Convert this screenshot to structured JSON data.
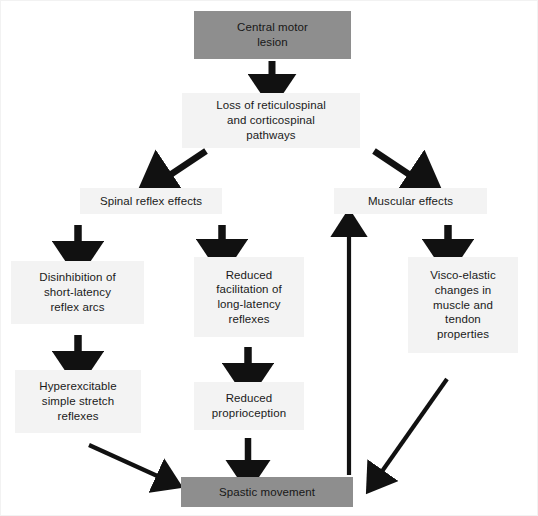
{
  "diagram": {
    "colors": {
      "dark_box": "#8e8e8e",
      "light_box": "#f3f3f3",
      "arrow": "#111111",
      "text": "#1a1a1a",
      "background": "#ffffff",
      "frame": "#f2f2f2"
    },
    "nodes": [
      {
        "id": "central-motor-lesion",
        "label": "Central motor\nlesion",
        "style": "dark",
        "x": 193,
        "y": 10,
        "w": 157,
        "h": 48
      },
      {
        "id": "loss-of-pathways",
        "label": "Loss of reticulospinal\nand corticospinal\npathways",
        "style": "light",
        "x": 181,
        "y": 92,
        "w": 178,
        "h": 55
      },
      {
        "id": "spinal-reflex-effects",
        "label": "Spinal reflex effects",
        "style": "light",
        "x": 79,
        "y": 187,
        "w": 142,
        "h": 26
      },
      {
        "id": "muscular-effects",
        "label": "Muscular effects",
        "style": "light",
        "x": 333,
        "y": 187,
        "w": 153,
        "h": 26
      },
      {
        "id": "disinhibition-short-latency",
        "label": "Disinhibition of\nshort-latency\nreflex arcs",
        "style": "light",
        "x": 10,
        "y": 260,
        "w": 133,
        "h": 63
      },
      {
        "id": "reduced-facilitation",
        "label": "Reduced\nfacilitation of\nlong-latency\nreflexes",
        "style": "light",
        "x": 193,
        "y": 256,
        "w": 110,
        "h": 80
      },
      {
        "id": "visco-elastic-changes",
        "label": "Visco-elastic\nchanges in\nmuscle and\ntendon\nproperties",
        "style": "light",
        "x": 407,
        "y": 256,
        "w": 110,
        "h": 96
      },
      {
        "id": "hyperexcitable-stretch-reflexes",
        "label": "Hyperexcitable\nsimple stretch\nreflexes",
        "style": "light",
        "x": 14,
        "y": 369,
        "w": 126,
        "h": 63
      },
      {
        "id": "reduced-proprioception",
        "label": "Reduced\nproprioception",
        "style": "light",
        "x": 193,
        "y": 381,
        "w": 110,
        "h": 48
      },
      {
        "id": "spastic-movement",
        "label": "Spastic movement",
        "style": "dark",
        "x": 180,
        "y": 476,
        "w": 172,
        "h": 30
      }
    ],
    "arrows": [
      {
        "id": "arrow-lesion-to-loss",
        "from": "central-motor-lesion",
        "to": "loss-of-pathways",
        "kind": "vertical-down"
      },
      {
        "id": "arrow-loss-to-spinal",
        "from": "loss-of-pathways",
        "to": "spinal-reflex-effects",
        "kind": "diagonal-down-left"
      },
      {
        "id": "arrow-loss-to-muscular",
        "from": "loss-of-pathways",
        "to": "muscular-effects",
        "kind": "diagonal-down-right"
      },
      {
        "id": "arrow-spinal-to-disinhibition",
        "from": "spinal-reflex-effects",
        "to": "disinhibition-short-latency",
        "kind": "vertical-down"
      },
      {
        "id": "arrow-spinal-to-reduced-facilitation",
        "from": "spinal-reflex-effects",
        "to": "reduced-facilitation",
        "kind": "vertical-down"
      },
      {
        "id": "arrow-muscular-to-visco-elastic",
        "from": "muscular-effects",
        "to": "visco-elastic-changes",
        "kind": "vertical-down"
      },
      {
        "id": "arrow-disinhibition-to-hyperexcitable",
        "from": "disinhibition-short-latency",
        "to": "hyperexcitable-stretch-reflexes",
        "kind": "vertical-down"
      },
      {
        "id": "arrow-facilitation-to-proprioception",
        "from": "reduced-facilitation",
        "to": "reduced-proprioception",
        "kind": "vertical-down"
      },
      {
        "id": "arrow-hyperexcitable-to-spastic",
        "from": "hyperexcitable-stretch-reflexes",
        "to": "spastic-movement",
        "kind": "diagonal-down-right"
      },
      {
        "id": "arrow-proprioception-to-spastic",
        "from": "reduced-proprioception",
        "to": "spastic-movement",
        "kind": "vertical-down"
      },
      {
        "id": "arrow-visco-elastic-to-spastic",
        "from": "visco-elastic-changes",
        "to": "spastic-movement",
        "kind": "diagonal-down-left"
      },
      {
        "id": "arrow-spastic-to-muscular",
        "from": "spastic-movement",
        "to": "muscular-effects",
        "kind": "vertical-up-long"
      }
    ]
  }
}
